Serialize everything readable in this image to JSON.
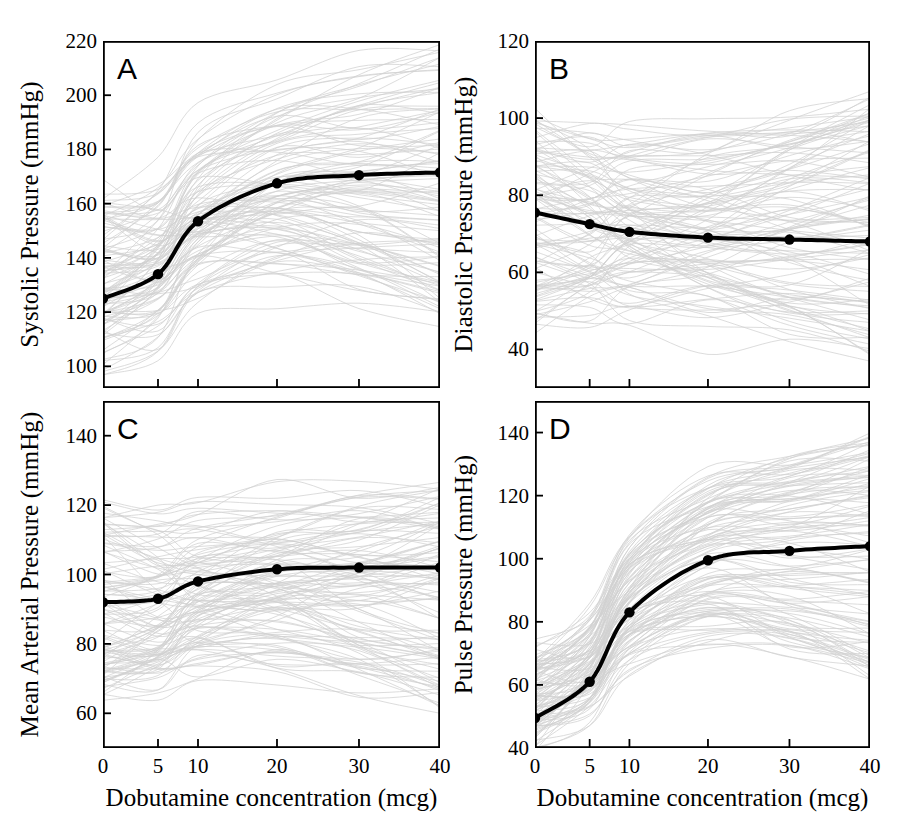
{
  "figure": {
    "title": "",
    "background": "#ffffff",
    "mean_color": "#000000",
    "spaghetti_color": "#c9c9c9",
    "axis_color": "#000000"
  },
  "axis": {
    "x_label": "Dobutamine concentration (mcg)",
    "x_ticks": [
      "0",
      "5",
      "10",
      "20",
      "30",
      "40"
    ],
    "x_tick_values": [
      0,
      5,
      10,
      20,
      30,
      40
    ]
  },
  "panels": {
    "A": {
      "letter": "A",
      "y_label": "Systolic Pressure (mmHg)",
      "y_ticks": [
        "100",
        "120",
        "140",
        "160",
        "180",
        "200",
        "220"
      ],
      "y_tick_values": [
        100,
        120,
        140,
        160,
        180,
        200,
        220
      ],
      "ylim": [
        92,
        220
      ],
      "x_tick_labels_shown": false
    },
    "B": {
      "letter": "B",
      "y_label": "Diastolic Pressure (mmHg)",
      "y_ticks": [
        "40",
        "60",
        "80",
        "100",
        "120"
      ],
      "y_tick_values": [
        40,
        60,
        80,
        100,
        120
      ],
      "ylim": [
        30,
        120
      ],
      "x_tick_labels_shown": false
    },
    "C": {
      "letter": "C",
      "y_label": "Mean Arterial Pressure  (mmHg)",
      "y_ticks": [
        "60",
        "80",
        "100",
        "120",
        "140"
      ],
      "y_tick_values": [
        60,
        80,
        100,
        120,
        140
      ],
      "ylim": [
        50,
        150
      ],
      "x_tick_labels_shown": true
    },
    "D": {
      "letter": "D",
      "y_label": "Pulse Pressure  (mmHg)",
      "y_ticks": [
        "40",
        "60",
        "80",
        "100",
        "120",
        "140"
      ],
      "y_tick_values": [
        40,
        60,
        80,
        100,
        120,
        140
      ],
      "ylim": [
        40,
        150
      ],
      "x_tick_labels_shown": true
    }
  },
  "chart_data": [
    {
      "type": "line",
      "panel": "A",
      "title": "A",
      "xlabel": "Dobutamine concentration (mcg)",
      "ylabel": "Systolic Pressure (mmHg)",
      "x": [
        0,
        5,
        10,
        20,
        30,
        40
      ],
      "xlim": [
        0,
        40
      ],
      "ylim": [
        92,
        220
      ],
      "grid": false,
      "legend": "none",
      "series": [
        {
          "name": "Mean systolic pressure",
          "values": [
            125,
            134,
            153.5,
            167.5,
            170.5,
            171.5
          ],
          "marker": "circle",
          "linewidth": 4
        }
      ],
      "background_traces": {
        "description": "individual subject spaghetti traces",
        "count": 120,
        "color": "#c9c9c9",
        "start_range": [
          95,
          165
        ],
        "end_range": [
          118,
          218
        ]
      }
    },
    {
      "type": "line",
      "panel": "B",
      "title": "B",
      "xlabel": "Dobutamine concentration (mcg)",
      "ylabel": "Diastolic Pressure (mmHg)",
      "x": [
        0,
        5,
        10,
        20,
        30,
        40
      ],
      "xlim": [
        0,
        40
      ],
      "ylim": [
        30,
        120
      ],
      "grid": false,
      "legend": "none",
      "series": [
        {
          "name": "Mean diastolic pressure",
          "values": [
            75.5,
            72.5,
            70.5,
            69,
            68.5,
            68
          ],
          "marker": "circle",
          "linewidth": 4
        }
      ],
      "background_traces": {
        "description": "individual subject spaghetti traces",
        "count": 120,
        "color": "#c9c9c9",
        "start_range": [
          45,
          100
        ],
        "end_range": [
          38,
          107
        ]
      }
    },
    {
      "type": "line",
      "panel": "C",
      "title": "C",
      "xlabel": "Dobutamine concentration (mcg)",
      "ylabel": "Mean Arterial Pressure  (mmHg)",
      "x": [
        0,
        5,
        10,
        20,
        30,
        40
      ],
      "xlim": [
        0,
        40
      ],
      "ylim": [
        50,
        150
      ],
      "grid": false,
      "legend": "none",
      "series": [
        {
          "name": "Mean arterial pressure",
          "values": [
            92,
            93,
            98,
            101.5,
            102,
            102
          ],
          "marker": "circle",
          "linewidth": 4
        }
      ],
      "background_traces": {
        "description": "individual subject spaghetti traces",
        "count": 120,
        "color": "#c9c9c9",
        "start_range": [
          66,
          120
        ],
        "end_range": [
          62,
          126
        ]
      }
    },
    {
      "type": "line",
      "panel": "D",
      "title": "D",
      "xlabel": "Dobutamine concentration (mcg)",
      "ylabel": "Pulse Pressure  (mmHg)",
      "x": [
        0,
        5,
        10,
        20,
        30,
        40
      ],
      "xlim": [
        0,
        40
      ],
      "ylim": [
        40,
        150
      ],
      "grid": false,
      "legend": "none",
      "series": [
        {
          "name": "Mean pulse pressure",
          "values": [
            49.5,
            61,
            83,
            99.5,
            102.5,
            104
          ],
          "marker": "circle",
          "linewidth": 4
        }
      ],
      "background_traces": {
        "description": "individual subject spaghetti traces",
        "count": 120,
        "color": "#c9c9c9",
        "start_range": [
          41,
          72
        ],
        "end_range": [
          60,
          140
        ]
      }
    }
  ]
}
